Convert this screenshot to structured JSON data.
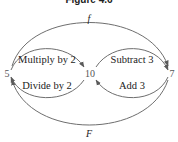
{
  "figure": {
    "title": "Figure 4.6"
  },
  "nodes": [
    {
      "id": "n5",
      "label": "5"
    },
    {
      "id": "n10",
      "label": "10"
    },
    {
      "id": "n7",
      "label": "7"
    }
  ],
  "edges": {
    "f": {
      "label": "f",
      "from": "5",
      "to": "7"
    },
    "F": {
      "label": "F",
      "from": "7",
      "to": "5"
    },
    "multiply": {
      "label": "Multiply by 2",
      "from": "5",
      "to": "10"
    },
    "divide": {
      "label": "Divide by 2",
      "from": "10",
      "to": "5"
    },
    "subtract": {
      "label": "Subtract 3",
      "from": "10",
      "to": "7"
    },
    "add": {
      "label": "Add 3",
      "from": "7",
      "to": "10"
    }
  },
  "colors": {
    "stroke": "#6e6e6e",
    "text": "#222222",
    "background": "#ffffff"
  }
}
